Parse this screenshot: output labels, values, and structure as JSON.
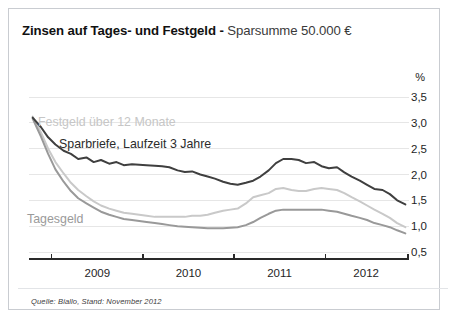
{
  "title": {
    "strong": "Zinsen auf Tages- und Festgeld",
    "separator": " - ",
    "light": "Sparsumme 50.000 €"
  },
  "source_note": "Quelle: Biallo, Stand: November 2012",
  "axis_unit": "%",
  "series_labels": {
    "festgeld": "Festgeld über 12 Monate",
    "sparbriefe": "Sparbriefe, Laufzeit 3 Jahre",
    "tagesgeld": "Tagesgeld"
  },
  "colors": {
    "sparbriefe": "#3f3f3f",
    "festgeld": "#c9c9c9",
    "tagesgeld": "#999999",
    "gridline": "#e6e6e6",
    "axis": "#2a2a2a",
    "border": "#c9ccd1",
    "title_strong": "#111111",
    "title_light": "#3a3a3a"
  },
  "chart_data": {
    "type": "line",
    "title": "Zinsen auf Tages- und Festgeld - Sparsumme 50.000 €",
    "subtitle": "",
    "xlabel": "",
    "ylabel": "%",
    "ylim": [
      0.5,
      3.5
    ],
    "yticks": [
      "0,5",
      "1,0",
      "1,5",
      "2,0",
      "2,5",
      "3,0",
      "3,5"
    ],
    "ytick_values": [
      0.5,
      1.0,
      1.5,
      2.0,
      2.5,
      3.0,
      3.5
    ],
    "xlim": [
      2008.75,
      2012.92
    ],
    "xticks": [
      "2009",
      "2010",
      "2011",
      "2012"
    ],
    "xtick_values": [
      2009.0,
      2010.0,
      2011.0,
      2012.0
    ],
    "xtick_label_positions": [
      2009.5,
      2010.5,
      2011.5,
      2012.45
    ],
    "grid": true,
    "grid_axis": "y",
    "legend": "inline-labels",
    "annotations": [
      "Festgeld über 12 Monate",
      "Sparbriefe, Laufzeit 3 Jahre",
      "Tagesgeld"
    ],
    "x": [
      2008.79,
      2008.88,
      2008.96,
      2009.04,
      2009.13,
      2009.21,
      2009.29,
      2009.38,
      2009.46,
      2009.54,
      2009.63,
      2009.71,
      2009.79,
      2009.88,
      2009.96,
      2010.04,
      2010.13,
      2010.21,
      2010.29,
      2010.38,
      2010.46,
      2010.54,
      2010.63,
      2010.71,
      2010.79,
      2010.88,
      2010.96,
      2011.04,
      2011.13,
      2011.21,
      2011.29,
      2011.38,
      2011.46,
      2011.54,
      2011.63,
      2011.71,
      2011.79,
      2011.88,
      2011.96,
      2012.04,
      2012.13,
      2012.21,
      2012.29,
      2012.38,
      2012.46,
      2012.54,
      2012.63,
      2012.71,
      2012.79,
      2012.88
    ],
    "series": [
      {
        "name": "Sparbriefe, Laufzeit 3 Jahre",
        "color": "#3f3f3f",
        "values": [
          3.1,
          2.92,
          2.72,
          2.58,
          2.46,
          2.4,
          2.3,
          2.33,
          2.24,
          2.28,
          2.21,
          2.24,
          2.18,
          2.2,
          2.19,
          2.18,
          2.17,
          2.16,
          2.14,
          2.08,
          2.05,
          2.06,
          2.0,
          1.96,
          1.92,
          1.86,
          1.82,
          1.8,
          1.84,
          1.88,
          1.96,
          2.08,
          2.22,
          2.3,
          2.3,
          2.28,
          2.22,
          2.24,
          2.16,
          2.12,
          2.14,
          2.04,
          1.96,
          1.88,
          1.8,
          1.72,
          1.7,
          1.62,
          1.5,
          1.42
        ]
      },
      {
        "name": "Festgeld über 12 Monate",
        "color": "#c9c9c9",
        "values": [
          3.12,
          2.82,
          2.5,
          2.24,
          2.02,
          1.84,
          1.7,
          1.58,
          1.48,
          1.4,
          1.34,
          1.3,
          1.26,
          1.24,
          1.22,
          1.2,
          1.18,
          1.18,
          1.18,
          1.18,
          1.18,
          1.2,
          1.2,
          1.22,
          1.26,
          1.3,
          1.32,
          1.34,
          1.44,
          1.56,
          1.6,
          1.64,
          1.72,
          1.74,
          1.7,
          1.68,
          1.68,
          1.72,
          1.74,
          1.72,
          1.7,
          1.64,
          1.56,
          1.48,
          1.4,
          1.32,
          1.24,
          1.16,
          1.06,
          0.98
        ]
      },
      {
        "name": "Tagesgeld",
        "color": "#999999",
        "values": [
          3.08,
          2.74,
          2.4,
          2.1,
          1.86,
          1.68,
          1.54,
          1.44,
          1.36,
          1.28,
          1.22,
          1.18,
          1.14,
          1.12,
          1.1,
          1.08,
          1.06,
          1.04,
          1.02,
          1.0,
          0.99,
          0.98,
          0.97,
          0.96,
          0.96,
          0.96,
          0.97,
          0.98,
          1.02,
          1.08,
          1.16,
          1.24,
          1.3,
          1.32,
          1.32,
          1.32,
          1.32,
          1.32,
          1.32,
          1.3,
          1.28,
          1.24,
          1.2,
          1.16,
          1.12,
          1.06,
          1.02,
          0.98,
          0.92,
          0.86
        ]
      }
    ]
  }
}
